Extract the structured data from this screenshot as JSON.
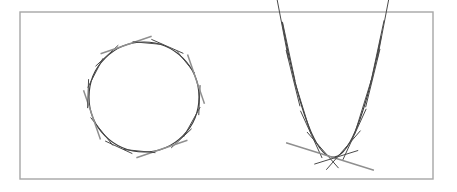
{
  "figure": {
    "background_color": "#ffffff",
    "frame": {
      "name": "figure-border",
      "x": 20,
      "y": 12,
      "width": 413,
      "height": 167,
      "stroke": "#a6a6a6",
      "stroke_width": 1.4
    },
    "colors": {
      "curve": "#3a3a3a",
      "tangent_dark": "#4a4a4a",
      "tangent_gray": "#8f8f8f",
      "frame": "#a6a6a6",
      "background": "#ffffff"
    },
    "panels": [
      {
        "name": "circle-envelope-panel",
        "label": "Circle envelope",
        "curve_type": "circle",
        "center_x": 144,
        "center_y": 97,
        "radius": 55,
        "tangent_count": 16,
        "tangent_half_length": 30,
        "tangent_angles_deg": [
          4,
          27,
          49,
          71,
          94,
          116,
          139,
          161,
          184,
          206,
          229,
          251,
          274,
          296,
          319,
          341
        ],
        "gray_tangent_indices": [
          3,
          7,
          11,
          15
        ],
        "tangent_jitter_deg": [
          -1.5,
          2.0,
          -2.2,
          0.0,
          1.8,
          -1.1,
          2.4,
          0.0,
          -2.0,
          1.4,
          -1.7,
          0.0,
          1.2,
          -2.3,
          1.9,
          0.0
        ],
        "tangent_offsets": [
          2,
          -4,
          3,
          0,
          -3,
          5,
          -2,
          0,
          4,
          -3,
          2,
          0,
          -4,
          3,
          -2,
          0
        ],
        "tangent_lengths": [
          30,
          34,
          28,
          54,
          32,
          30,
          36,
          52,
          29,
          33,
          31,
          54,
          30,
          35,
          28,
          52
        ]
      },
      {
        "name": "parabola-envelope-panel",
        "label": "Parabola envelope",
        "curve_type": "parabola",
        "vertex_x": 333,
        "vertex_y": 157,
        "coefficient": 0.052,
        "x_min": 282,
        "x_max": 382,
        "y_top": 28,
        "tangent_count": 14,
        "tangent_points_x": [
          283,
          288,
          294,
          302,
          312,
          322,
          330,
          336,
          344,
          354,
          364,
          372,
          378,
          383
        ],
        "gray_tangent_indices": [
          6
        ],
        "tangent_lengths": [
          66,
          60,
          58,
          56,
          52,
          48,
          92,
          46,
          52,
          56,
          58,
          60,
          64,
          66
        ],
        "tangent_offsets": [
          1.5,
          -2.0,
          2.5,
          -1.5,
          2.0,
          -2.5,
          0,
          2.0,
          -2.0,
          1.5,
          -2.5,
          2.0,
          -1.5,
          1.0
        ]
      }
    ]
  }
}
